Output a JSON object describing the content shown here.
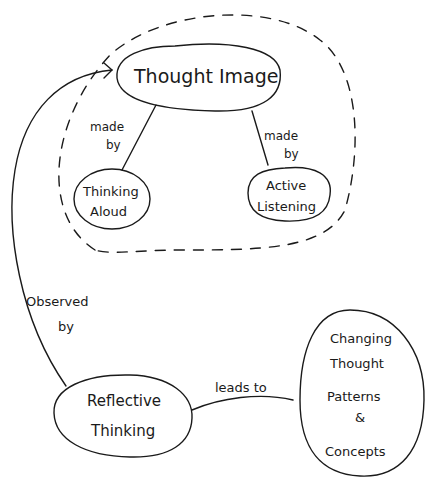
{
  "diagram": {
    "type": "concept-map",
    "style": "hand-drawn",
    "nodes": {
      "thought_image": {
        "label": "Thought Image"
      },
      "thinking_aloud": {
        "line1": "Thinking",
        "line2": "Aloud"
      },
      "active_listening": {
        "line1": "Active",
        "line2": "Listening"
      },
      "reflective_thinking": {
        "line1": "Reflective",
        "line2": "Thinking"
      },
      "changing_patterns": {
        "line1": "Changing",
        "line2": "Thought",
        "line3": "Patterns",
        "line4": "&",
        "line5": "Concepts"
      }
    },
    "edges": {
      "made_by_left": {
        "line1": "made",
        "line2": "by",
        "from": "Thought Image",
        "to": "Thinking Aloud"
      },
      "made_by_right": {
        "line1": "made",
        "line2": "by",
        "from": "Thought Image",
        "to": "Active Listening"
      },
      "observed_by": {
        "line1": "Observed",
        "line2": "by",
        "from": "Reflective Thinking",
        "to": "Thought Image"
      },
      "leads_to": {
        "label": "leads to",
        "from": "Reflective Thinking",
        "to": "Changing Thought Patterns & Concepts"
      }
    },
    "group": {
      "name": "thought-image-cluster",
      "style": "dashed"
    }
  }
}
